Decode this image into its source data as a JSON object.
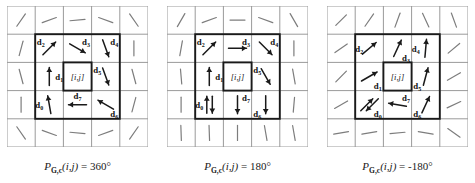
{
  "figure": {
    "type": "vector-field-grid-diagram",
    "background": "#ffffff",
    "line_color": "#9a9a9a",
    "bold_line_color": "#1a1a1a",
    "arrow_color": "#1a1a1a",
    "center_label": "[i,j]"
  },
  "panels": [
    {
      "id": "panel-360",
      "caption": {
        "symbol": "P",
        "subscript": "G,c",
        "args": "(i,j)",
        "equals": "=",
        "value": "360°",
        "full": "P G,c (i,j) = 360°"
      },
      "center_cell_label": "[i,j]",
      "neighbors": [
        {
          "name": "d0",
          "label": "d",
          "index": "0",
          "cell": "bottom-left",
          "angle_deg": 100,
          "label_pos": "left"
        },
        {
          "name": "d1",
          "label": "d",
          "index": "1",
          "cell": "middle-left",
          "angle_deg": 90,
          "label_pos": "right"
        },
        {
          "name": "d2",
          "label": "d",
          "index": "2",
          "cell": "top-left",
          "angle_deg": 45,
          "label_pos": "topleft"
        },
        {
          "name": "d3",
          "label": "d",
          "index": "3",
          "cell": "top-center",
          "angle_deg": -30,
          "label_pos": "topright"
        },
        {
          "name": "d4",
          "label": "d",
          "index": "4",
          "cell": "top-right",
          "angle_deg": -70,
          "label_pos": "topright"
        },
        {
          "name": "d5",
          "label": "d",
          "index": "5",
          "cell": "middle-right",
          "angle_deg": -70,
          "label_pos": "topleft"
        },
        {
          "name": "d6",
          "label": "d",
          "index": "6",
          "cell": "bottom-right",
          "angle_deg": 150,
          "label_pos": "bottomright"
        },
        {
          "name": "d7",
          "label": "d",
          "index": "7",
          "cell": "bottom-center",
          "angle_deg": 180,
          "label_pos": "top"
        }
      ],
      "outer_segments_angles_deg": [
        55,
        20,
        5,
        -20,
        -55,
        75,
        90,
        105,
        -75,
        -90,
        -105,
        -55,
        -20,
        -5,
        20,
        55
      ]
    },
    {
      "id": "panel-180",
      "caption": {
        "symbol": "P",
        "subscript": "G,c",
        "args": "(i,j)",
        "equals": "=",
        "value": "180°",
        "full": "P G,c (i,j) = 180°"
      },
      "center_cell_label": "[i,j]",
      "neighbors": [
        {
          "name": "d0",
          "label": "d",
          "index": "0",
          "cell": "bottom-left",
          "angle_deg": 90,
          "label_pos": "left",
          "double": true
        },
        {
          "name": "d1",
          "label": "d",
          "index": "1",
          "cell": "middle-left",
          "angle_deg": 90,
          "label_pos": "right"
        },
        {
          "name": "d2",
          "label": "d",
          "index": "2",
          "cell": "top-left",
          "angle_deg": 45,
          "label_pos": "topleft"
        },
        {
          "name": "d3",
          "label": "d",
          "index": "3",
          "cell": "top-center",
          "angle_deg": 0,
          "label_pos": "topright"
        },
        {
          "name": "d4",
          "label": "d",
          "index": "4",
          "cell": "top-right",
          "angle_deg": -45,
          "label_pos": "topright"
        },
        {
          "name": "d5",
          "label": "d",
          "index": "5",
          "cell": "middle-right",
          "angle_deg": -60,
          "label_pos": "topleft"
        },
        {
          "name": "d6",
          "label": "d",
          "index": "6",
          "cell": "bottom-right",
          "angle_deg": -90,
          "label_pos": "bottomleft"
        },
        {
          "name": "d7",
          "label": "d",
          "index": "7",
          "cell": "bottom-center",
          "angle_deg": -90,
          "label_pos": "topright"
        }
      ],
      "outer_segments_angles_deg": [
        60,
        20,
        0,
        -20,
        -60,
        80,
        90,
        95,
        -80,
        -90,
        -95,
        -88,
        -88,
        -90,
        -80,
        -80
      ]
    },
    {
      "id": "panel-minus180",
      "caption": {
        "symbol": "P",
        "subscript": "G,c",
        "args": "(i,j)",
        "equals": "=",
        "value": "-180°",
        "full": "P G,c (i,j) = -180°"
      },
      "center_cell_label": "[i,j]",
      "neighbors": [
        {
          "name": "d0",
          "label": "d",
          "index": "0",
          "cell": "bottom-left",
          "angle_deg": 45,
          "label_pos": "bottomright",
          "double": true
        },
        {
          "name": "d1",
          "label": "d",
          "index": "1",
          "cell": "middle-left",
          "angle_deg": 30,
          "label_pos": "bottomright"
        },
        {
          "name": "d2",
          "label": "d",
          "index": "2",
          "cell": "top-left",
          "angle_deg": 40,
          "label_pos": "left"
        },
        {
          "name": "d3",
          "label": "d",
          "index": "3",
          "cell": "top-center",
          "angle_deg": 65,
          "label_pos": "bottomright"
        },
        {
          "name": "d4",
          "label": "d",
          "index": "4",
          "cell": "top-right",
          "angle_deg": 85,
          "label_pos": "left"
        },
        {
          "name": "d5",
          "label": "d",
          "index": "5",
          "cell": "middle-right",
          "angle_deg": 75,
          "label_pos": "bottomleft"
        },
        {
          "name": "d6",
          "label": "d",
          "index": "6",
          "cell": "bottom-right",
          "angle_deg": 65,
          "label_pos": "bottomleft"
        },
        {
          "name": "d7",
          "label": "d",
          "index": "7",
          "cell": "bottom-center",
          "angle_deg": 170,
          "label_pos": "topright"
        }
      ],
      "outer_segments_angles_deg": [
        45,
        55,
        70,
        -65,
        -70,
        35,
        40,
        45,
        30,
        30,
        25,
        10,
        10,
        5,
        -10,
        -35
      ]
    }
  ]
}
